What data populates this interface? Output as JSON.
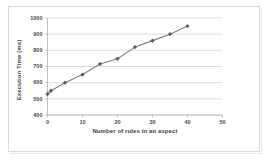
{
  "chart_data": {
    "type": "line",
    "title": "",
    "xlabel": "Number of rules in an aspect",
    "ylabel": "Execution Time (ms)",
    "xlim": [
      0,
      50
    ],
    "ylim": [
      400,
      1000
    ],
    "x_ticks": [
      0,
      10,
      20,
      30,
      40,
      50
    ],
    "y_ticks": [
      400,
      500,
      600,
      700,
      800,
      900,
      1000
    ],
    "grid": "horizontal",
    "legend": "none",
    "marker": "diamond",
    "series": [
      {
        "name": "Execution Time",
        "x": [
          0,
          1,
          5,
          10,
          15,
          20,
          25,
          30,
          35,
          40
        ],
        "values": [
          530,
          550,
          600,
          650,
          715,
          748,
          820,
          860,
          900,
          950
        ]
      }
    ],
    "colors": {
      "line": "#7f7f7f",
      "marker": "#595959",
      "gridline": "#d0d0d0",
      "axis": "#b0b0b0",
      "text": "#3f3f3f",
      "background": "#ffffff",
      "frame": "#d9d9d9"
    }
  },
  "x_tick_labels": [
    "0",
    "10",
    "20",
    "30",
    "40",
    "50"
  ],
  "y_tick_labels": [
    "400",
    "500",
    "600",
    "700",
    "800",
    "900",
    "1000"
  ]
}
